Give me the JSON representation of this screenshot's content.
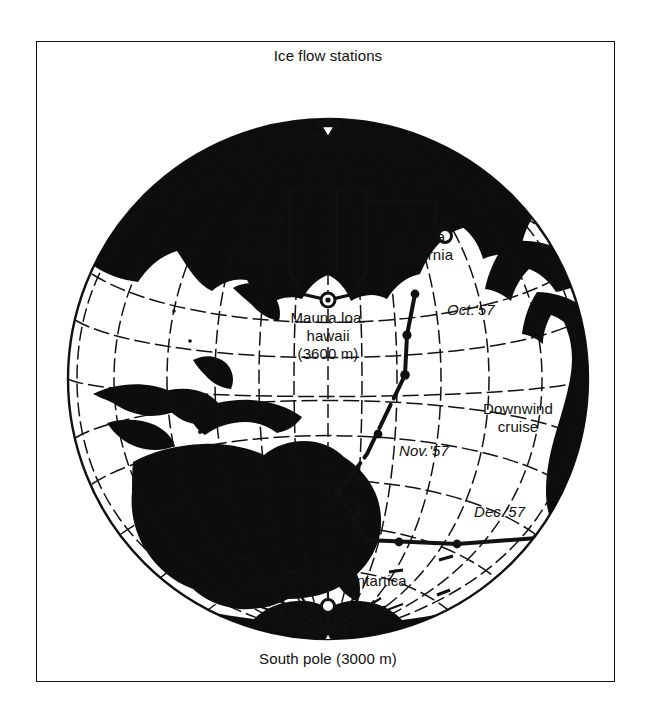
{
  "figure": {
    "domain": "map",
    "projection": "orthographic globe centered on the Pacific Ocean",
    "background_color": "#ffffff",
    "ink_color": "#111111",
    "frame": {
      "border_color": "#111111"
    }
  },
  "labels": {
    "ice_flow_stations": "Ice flow stations",
    "aircraft_tracks_l1": "Aircraft",
    "aircraft_tracks_l2": "tracks",
    "aircraft_tracks_l3": "(6000 m)",
    "la_jolla_l1": "La Jolla.",
    "la_jolla_l2": "California",
    "mauna_loa_l1": "Mauna loa.",
    "mauna_loa_l2": "hawaii",
    "mauna_loa_l3": "(3600 m)",
    "oct57": "Oct.'57",
    "nov57": "Nov.'57",
    "dec57": "Dec.'57",
    "downwind_l1": "Downwind",
    "downwind_l2": "cruise",
    "little_america": "Little america, antartica",
    "south_pole": "South pole (3000 m)"
  },
  "markers": [
    {
      "name": "north-pole-station",
      "label": "Ice flow stations",
      "symbol": "triangle",
      "x": 291,
      "y": 42
    },
    {
      "name": "mauna-loa-station",
      "label": "Mauna loa. hawaii (3600 m)",
      "symbol": "circle-dot",
      "x": 291,
      "y": 258
    },
    {
      "name": "la-jolla-station",
      "label": "La Jolla. California",
      "symbol": "open-circle",
      "x": 408,
      "y": 194
    },
    {
      "name": "little-america-station",
      "label": "Little america, antartica",
      "symbol": "open-circle",
      "x": 291,
      "y": 564
    },
    {
      "name": "south-pole-station",
      "label": "South pole (3000 m)",
      "symbol": "triangle",
      "x": 291,
      "y": 597
    }
  ],
  "cruise": {
    "name": "Downwind cruise",
    "year": "1957",
    "segments": [
      {
        "month": "Oct.'57"
      },
      {
        "month": "Nov.'57"
      },
      {
        "month": "Dec.'57"
      }
    ]
  },
  "altitudes": {
    "aircraft_tracks_m": 6000,
    "mauna_loa_m": 3600,
    "south_pole_m": 3000
  }
}
